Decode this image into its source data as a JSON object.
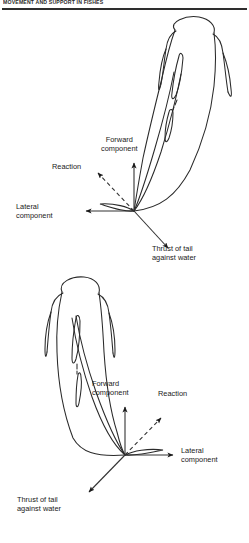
{
  "page": {
    "running_head": "MOVEMENT AND SUPPORT IN FISHES",
    "background_color": "#ffffff",
    "ink_color": "#1a1a1a"
  },
  "figure": {
    "panels": [
      {
        "id": "upper",
        "fish_orientation": "head upper-right, tail sweeping to lower-left",
        "vector_origin": {
          "x": 134,
          "y": 211
        },
        "labels": [
          {
            "name": "forward-component",
            "line1": "Forward",
            "line2": "component",
            "arrow": "up",
            "style": "solid"
          },
          {
            "name": "reaction",
            "line1": "Reaction",
            "line2": "",
            "arrow": "up-left",
            "style": "dashed"
          },
          {
            "name": "lateral-component",
            "line1": "Lateral",
            "line2": "component",
            "arrow": "left",
            "style": "solid"
          },
          {
            "name": "thrust-of-tail",
            "line1": "Thrust of tail",
            "line2": "against water",
            "arrow": "down-right",
            "style": "solid"
          }
        ]
      },
      {
        "id": "lower",
        "fish_orientation": "head upper-left, tail sweeping to lower-right",
        "vector_origin": {
          "x": 125,
          "y": 455
        },
        "labels": [
          {
            "name": "forward-component",
            "line1": "Forward",
            "line2": "component",
            "arrow": "up",
            "style": "solid"
          },
          {
            "name": "reaction",
            "line1": "Reaction",
            "line2": "",
            "arrow": "up-right",
            "style": "dashed"
          },
          {
            "name": "lateral-component",
            "line1": "Lateral",
            "line2": "component",
            "arrow": "right",
            "style": "solid"
          },
          {
            "name": "thrust-of-tail",
            "line1": "Thrust of tail",
            "line2": "against water",
            "arrow": "down-left",
            "style": "solid"
          }
        ]
      }
    ]
  }
}
